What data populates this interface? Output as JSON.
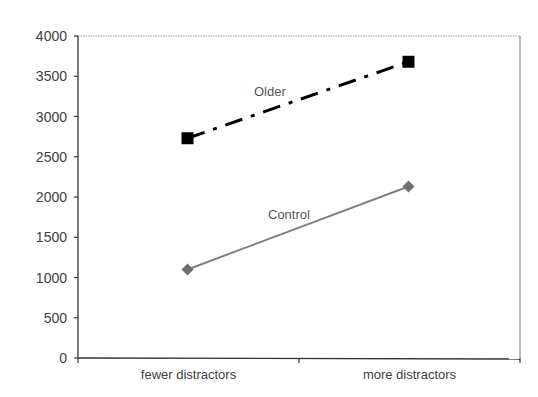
{
  "chart_data": {
    "type": "line",
    "title": "",
    "xlabel": "",
    "ylabel": "",
    "categories": [
      "fewer distractors",
      "more distractors"
    ],
    "ylim": [
      0,
      4000
    ],
    "yticks": [
      0,
      500,
      1000,
      1500,
      2000,
      2500,
      3000,
      3500,
      4000
    ],
    "ytick_labels": [
      "0",
      "500",
      "1000",
      "1500",
      "2000",
      "2500",
      "3000",
      "3500",
      "4000"
    ],
    "grid": false,
    "legend": "none (series labeled inline on plot)",
    "series": [
      {
        "name": "Older",
        "values": [
          2730,
          3680
        ],
        "color": "#000000",
        "line_style": "dash-dot",
        "marker": "square",
        "label_text": "Older"
      },
      {
        "name": "Control",
        "values": [
          1100,
          2130
        ],
        "color": "#808080",
        "line_style": "solid",
        "marker": "diamond",
        "label_text": "Control"
      }
    ]
  }
}
